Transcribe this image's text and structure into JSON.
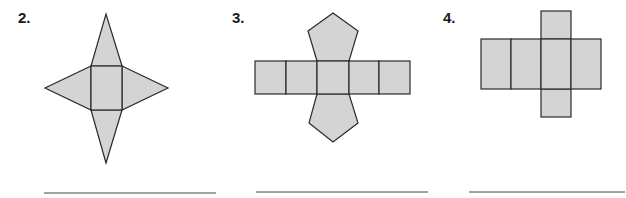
{
  "problems": [
    {
      "number": "2.",
      "figure": "net of square pyramid",
      "answer": ""
    },
    {
      "number": "3.",
      "figure": "net with five squares and two pentagons",
      "answer": ""
    },
    {
      "number": "4.",
      "figure": "net of rectangular prism",
      "answer": ""
    }
  ],
  "colors": {
    "fill": "#d4d4d4",
    "stroke": "#2a2a2a"
  }
}
